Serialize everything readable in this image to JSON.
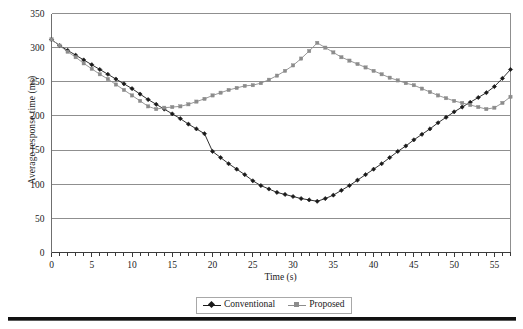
{
  "chart_data": {
    "type": "line",
    "title": "",
    "xlabel": "Time (s)",
    "ylabel": "Average response time (ms)",
    "xlim": [
      0,
      57
    ],
    "ylim": [
      0,
      350
    ],
    "ytick_step": 50,
    "xtick_step": 5,
    "x_minor_tick_step": 1,
    "grid": "horizontal",
    "legend_position": "bottom-center",
    "yticks": [
      "0",
      "50",
      "100",
      "150",
      "200",
      "250",
      "300",
      "350"
    ],
    "xticks": [
      "0",
      "5",
      "10",
      "15",
      "20",
      "25",
      "30",
      "35",
      "40",
      "45",
      "50",
      "55"
    ],
    "x": [
      0,
      1,
      2,
      3,
      4,
      5,
      6,
      7,
      8,
      9,
      10,
      11,
      12,
      13,
      14,
      15,
      16,
      17,
      18,
      19,
      20,
      21,
      22,
      23,
      24,
      25,
      26,
      27,
      28,
      29,
      30,
      31,
      32,
      33,
      34,
      35,
      36,
      37,
      38,
      39,
      40,
      41,
      42,
      43,
      44,
      45,
      46,
      47,
      48,
      49,
      50,
      51,
      52,
      53,
      54,
      55,
      56,
      57
    ],
    "series": [
      {
        "name": "Conventional",
        "color": "#1a1a1a",
        "marker": "diamond",
        "values": [
          312,
          303,
          296,
          289,
          282,
          275,
          268,
          261,
          254,
          247,
          240,
          232,
          224,
          217,
          210,
          203,
          196,
          188,
          181,
          174,
          148,
          139,
          130,
          122,
          114,
          105,
          98,
          93,
          88,
          85,
          82,
          79,
          77,
          75,
          79,
          84,
          91,
          98,
          106,
          114,
          122,
          130,
          139,
          148,
          156,
          165,
          173,
          181,
          190,
          198,
          206,
          213,
          220,
          227,
          234,
          243,
          255,
          268
        ]
      },
      {
        "name": "Proposed",
        "color": "#8c8c8c",
        "marker": "square",
        "values": [
          312,
          303,
          294,
          286,
          277,
          269,
          261,
          254,
          246,
          238,
          230,
          222,
          214,
          210,
          212,
          213,
          214,
          217,
          221,
          225,
          230,
          234,
          238,
          241,
          244,
          245,
          248,
          253,
          259,
          266,
          274,
          284,
          295,
          307,
          300,
          293,
          286,
          281,
          276,
          271,
          266,
          261,
          256,
          252,
          248,
          245,
          240,
          235,
          230,
          226,
          222,
          219,
          216,
          213,
          210,
          212,
          219,
          228
        ]
      }
    ]
  },
  "legend": {
    "entries": [
      {
        "label": "Conventional"
      },
      {
        "label": "Proposed"
      }
    ]
  },
  "colors": {
    "conventional": "#1a1a1a",
    "proposed": "#8c8c8c",
    "gridline": "#8f8f8f",
    "axis": "#6f6f6f",
    "background": "#ffffff"
  }
}
